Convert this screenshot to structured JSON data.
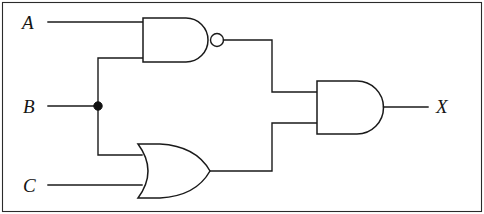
{
  "diagram": {
    "boolean_expression": "X = (A NAND B) AND (B OR C)",
    "background_color": "#ffffff",
    "line_color": "#1a1a1a",
    "frame_color": "#2b2b2b"
  },
  "labels": {
    "input_a": "A",
    "input_b": "B",
    "input_c": "C",
    "output_x": "X"
  },
  "gates": [
    {
      "id": "nand-gate",
      "type": "NAND",
      "inputs": [
        "A",
        "B"
      ],
      "output": "A NAND B",
      "inverted": true
    },
    {
      "id": "or-gate",
      "type": "OR",
      "inputs": [
        "B",
        "C"
      ],
      "output": "B OR C",
      "inverted": false
    },
    {
      "id": "and-gate",
      "type": "AND",
      "inputs": [
        "A NAND B",
        "B OR C"
      ],
      "output": "X",
      "inverted": false
    }
  ],
  "nodes": [
    {
      "id": "b-junction",
      "type": "junction-dot",
      "on_net": "B",
      "branches": [
        "nand-gate-input-2",
        "or-gate-input-1"
      ]
    }
  ],
  "geometry": {
    "nand": {
      "left": 143,
      "top": 18,
      "bottom": 62,
      "flat_right": 186,
      "arc_right": 210,
      "bubble_cx": 217,
      "bubble_cy": 40,
      "bubble_r": 6.5,
      "in1_y": 22,
      "in2_y": 57,
      "out_y": 40
    },
    "or": {
      "left": 138,
      "top": 144,
      "bottom": 198,
      "tip_x": 210,
      "in1_y": 155,
      "in2_y": 185,
      "out_y": 171
    },
    "and": {
      "left": 317,
      "top": 81,
      "bottom": 134,
      "flat_right": 357,
      "arc_right": 386,
      "in1_y": 92,
      "in2_y": 123,
      "out_y": 107
    },
    "wires": {
      "a_in_x_start": 48,
      "b_in_x_start": 48,
      "c_in_x_start": 48,
      "b_junction_x": 98,
      "b_junction_y": 106,
      "b_junction_r": 4.2,
      "b_up_y": 58,
      "b_down_y": 155,
      "nand_out_right_x": 272,
      "or_out_right_x": 272,
      "x_out_end_x": 428
    },
    "frame": {
      "x": 2,
      "y": 2,
      "width": 480,
      "height": 210
    }
  }
}
